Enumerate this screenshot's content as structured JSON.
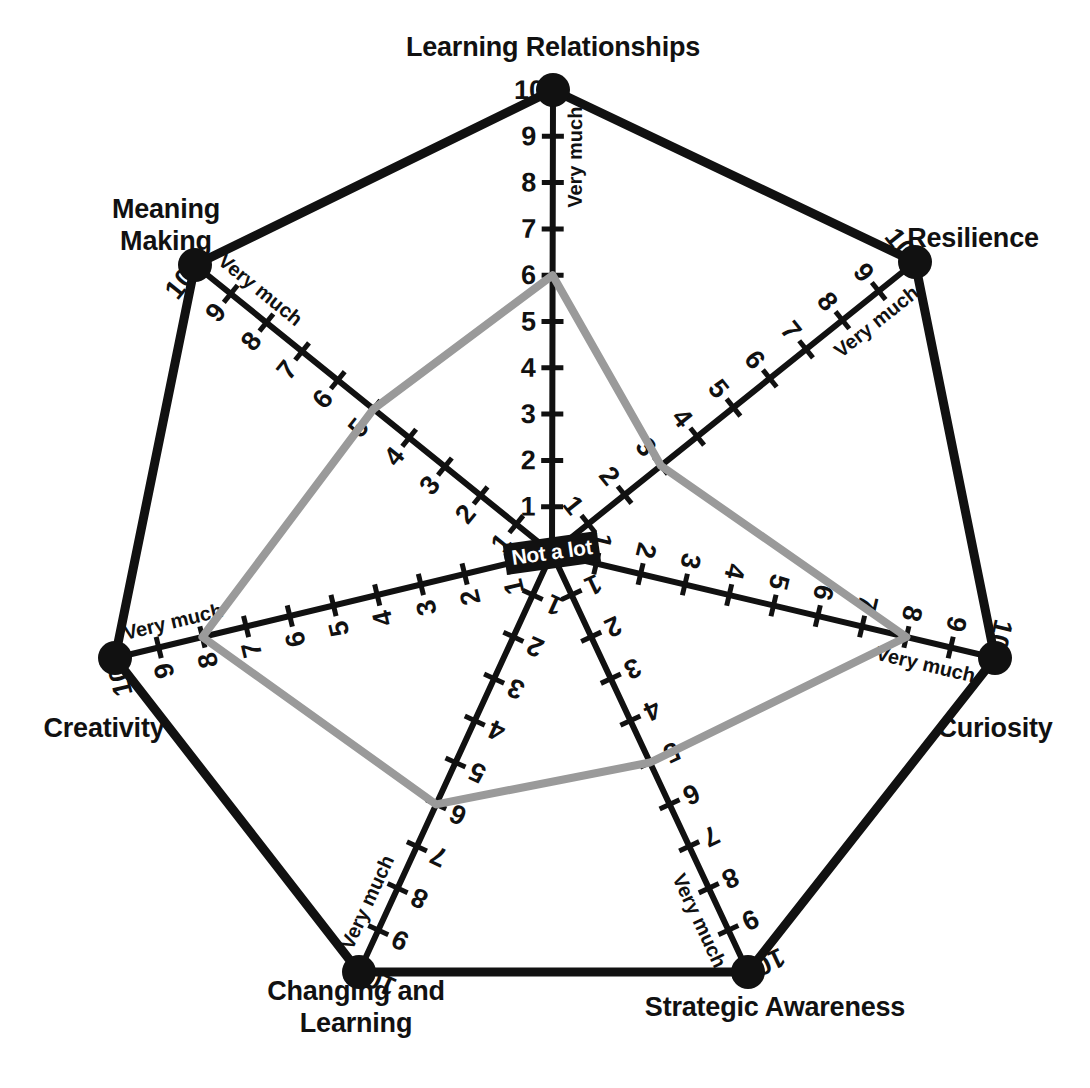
{
  "chart_data": {
    "type": "radar",
    "title": "",
    "center_label": "Not a lot",
    "outer_label": "Very much",
    "scale_min": 0,
    "scale_max": 10,
    "tick_labels": [
      "1",
      "2",
      "3",
      "4",
      "5",
      "6",
      "7",
      "8",
      "9",
      "10"
    ],
    "categories": [
      "Learning Relationships",
      "Resilience",
      "Curiosity",
      "Strategic Awareness",
      "Changing and\nLearning",
      "Creativity",
      "Meaning\nMaking"
    ],
    "series": [
      {
        "name": "Learning power profile",
        "color": "#9a9a9a",
        "values": [
          6,
          3,
          8,
          5,
          6,
          8,
          5
        ]
      }
    ],
    "axis_color": "#111111",
    "grid": false,
    "legend": "none"
  },
  "axes": [
    {
      "id": "learning-relationships",
      "label": "Learning Relationships",
      "value": 6,
      "angle_deg": -90,
      "vertex": {
        "x": 553,
        "y": 90
      },
      "title_pos": {
        "x": 553,
        "y": 48
      },
      "title_align": "center"
    },
    {
      "id": "resilience",
      "label": "Resilience",
      "value": 3,
      "angle_deg": -38.57,
      "vertex": {
        "x": 915,
        "y": 262
      },
      "title_pos": {
        "x": 973,
        "y": 239
      },
      "title_align": "center"
    },
    {
      "id": "curiosity",
      "label": "Curiosity",
      "value": 8,
      "angle_deg": 12.86,
      "vertex": {
        "x": 995,
        "y": 658
      },
      "title_pos": {
        "x": 995,
        "y": 729
      },
      "title_align": "center"
    },
    {
      "id": "strategic-awareness",
      "label": "Strategic Awareness",
      "value": 5,
      "angle_deg": 64.29,
      "vertex": {
        "x": 748,
        "y": 972
      },
      "title_pos": {
        "x": 775,
        "y": 1008
      },
      "title_align": "center"
    },
    {
      "id": "changing-and-learning",
      "label": "Changing and\nLearning",
      "value": 6,
      "angle_deg": 115.71,
      "vertex": {
        "x": 359,
        "y": 972
      },
      "title_pos": {
        "x": 356,
        "y": 1008
      },
      "title_align": "center"
    },
    {
      "id": "creativity",
      "label": "Creativity",
      "value": 8,
      "angle_deg": 167.14,
      "vertex": {
        "x": 115,
        "y": 658
      },
      "title_pos": {
        "x": 104,
        "y": 729
      },
      "title_align": "center"
    },
    {
      "id": "meaning-making",
      "label": "Meaning\nMaking",
      "value": 5,
      "angle_deg": -141.43,
      "vertex": {
        "x": 195,
        "y": 265
      },
      "title_pos": {
        "x": 166,
        "y": 226
      },
      "title_align": "center"
    }
  ],
  "center": {
    "x": 552,
    "y": 553,
    "label": "Not a lot"
  }
}
